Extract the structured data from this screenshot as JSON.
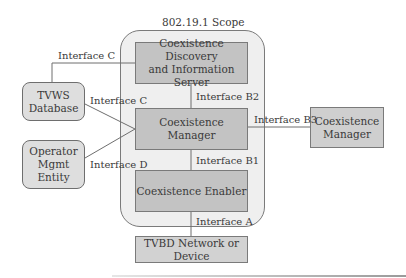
{
  "diagram": {
    "scope_label": "802.19.1 Scope",
    "nodes": {
      "cdis": {
        "label_line1": "Coexistence Discovery",
        "label_line2": "and Information Server"
      },
      "coexistence_manager": {
        "label": "Coexistence Manager"
      },
      "coexistence_enabler": {
        "label": "Coexistence Enabler"
      },
      "tvbd": {
        "label_line1": "TVBD Network or",
        "label_line2": "Device"
      },
      "tvws_database": {
        "label_line1": "TVWS",
        "label_line2": "Database"
      },
      "operator_mgmt": {
        "label_line1": "Operator",
        "label_line2": "Mgmt",
        "label_line3": "Entity"
      },
      "external_manager": {
        "label_line1": "Coexistence",
        "label_line2": "Manager"
      }
    },
    "interfaces": {
      "c_top": "Interface C",
      "c_mid": "Interface C",
      "d": "Interface D",
      "b2": "Interface B2",
      "b3": "Interface B3",
      "b1": "Interface B1",
      "a": "Interface A"
    },
    "colors": {
      "scope_fill": "#efefef",
      "inner_box_fill": "#c3c3c3",
      "outer_box_fill": "#dedede",
      "line": "#6e6e6e"
    }
  }
}
